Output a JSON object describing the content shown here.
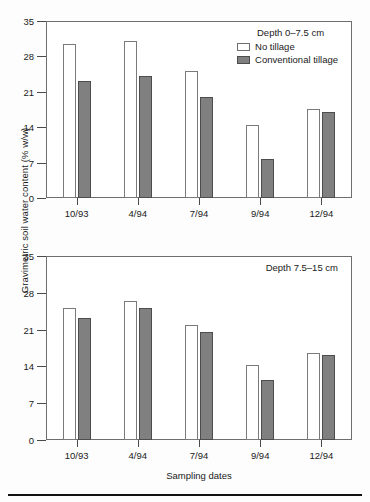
{
  "figure": {
    "ylabel": "Gravimetric soil water content (% w/w)",
    "xlabel": "Sampling dates"
  },
  "legend": {
    "series": [
      {
        "label": "No tillage",
        "color": "#ffffff",
        "key": "nt"
      },
      {
        "label": "Conventional tillage",
        "color": "#808080",
        "key": "ct"
      }
    ]
  },
  "panels": [
    {
      "annotation": "Depth 0–7.5 cm"
    },
    {
      "annotation": "Depth 7.5–15 cm"
    }
  ],
  "chart_data": [
    {
      "type": "bar",
      "title": "Depth 0–7.5 cm",
      "xlabel": "",
      "ylabel": "Gravimetric soil water content (% w/w)",
      "categories": [
        "10/93",
        "4/94",
        "7/94",
        "9/94",
        "12/94"
      ],
      "series": [
        {
          "name": "No tillage",
          "values": [
            30.4,
            31.0,
            25.2,
            14.5,
            17.6
          ]
        },
        {
          "name": "Conventional tillage",
          "values": [
            23.1,
            24.2,
            19.9,
            7.7,
            17.0
          ]
        }
      ],
      "ylim": [
        0,
        35
      ],
      "yticks": [
        0,
        7,
        14,
        21,
        28,
        35
      ],
      "grid": false,
      "legend_position": "top-right"
    },
    {
      "type": "bar",
      "title": "Depth 7.5–15 cm",
      "xlabel": "Sampling dates",
      "ylabel": "Gravimetric soil water content (% w/w)",
      "categories": [
        "10/93",
        "4/94",
        "7/94",
        "9/94",
        "12/94"
      ],
      "series": [
        {
          "name": "No tillage",
          "values": [
            25.1,
            26.4,
            21.8,
            14.2,
            16.6
          ]
        },
        {
          "name": "Conventional tillage",
          "values": [
            23.3,
            25.2,
            20.6,
            11.5,
            16.1
          ]
        }
      ],
      "ylim": [
        0,
        35
      ],
      "yticks": [
        0,
        7,
        14,
        21,
        28,
        35
      ],
      "grid": false,
      "legend_position": "none"
    }
  ]
}
